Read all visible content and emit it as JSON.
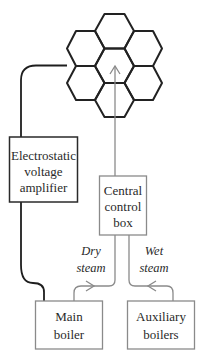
{
  "diagram": {
    "colors": {
      "hex_stroke": "#222222",
      "wire": "#1e1e1e",
      "steam_line": "#8a8a8a",
      "box_dark": "#2a2a2a",
      "box_light": "#8a8a8a",
      "text": "#2a2a2a"
    },
    "hex_grid": {
      "cells": 7,
      "label": ""
    },
    "boxes": {
      "amplifier": {
        "lines": [
          "Electrostatic",
          "voltage",
          "amplifier"
        ]
      },
      "control": {
        "lines": [
          "Central",
          "control",
          "box"
        ]
      },
      "main_boiler": {
        "lines": [
          "Main",
          "boiler"
        ]
      },
      "aux_boilers": {
        "lines": [
          "Auxiliary",
          "boilers"
        ]
      }
    },
    "flows": {
      "dry": {
        "lines": [
          "Dry",
          "steam"
        ]
      },
      "wet": {
        "lines": [
          "Wet",
          "steam"
        ]
      }
    }
  }
}
